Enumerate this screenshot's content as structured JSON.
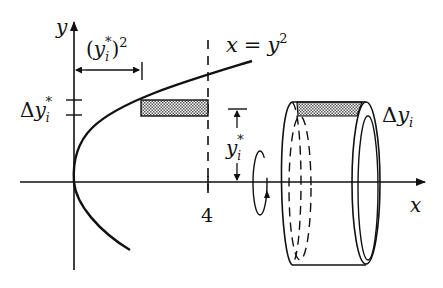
{
  "diagram": {
    "title": "",
    "axes": {
      "x_label": "x",
      "y_label": "y",
      "x_tick": "4"
    },
    "curve": {
      "equation_lhs": "x",
      "equation_eq": "=",
      "equation_rhs": "y",
      "equation_exp": "2"
    },
    "annotations": {
      "delta_y_star": {
        "delta": "Δ",
        "var": "y",
        "sub": "i",
        "sup": "*"
      },
      "y_star_squared": {
        "open": "(",
        "var": "y",
        "sub": "i",
        "sup": "*",
        "close": ")",
        "exp": "2"
      },
      "y_star": {
        "var": "y",
        "sub": "i",
        "sup": "*"
      },
      "delta_y_i": {
        "delta": "Δ",
        "var": "y",
        "sub": "i"
      }
    },
    "colors": {
      "ink": "#111111",
      "shading": "#9a9a9a",
      "background": "#ffffff"
    }
  }
}
